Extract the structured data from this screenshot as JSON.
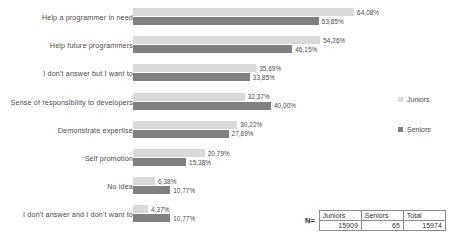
{
  "chart_data": {
    "type": "bar",
    "orientation": "horizontal",
    "title": "",
    "subtitle": "",
    "xlabel": "",
    "ylabel": "",
    "grid": false,
    "xlim": [
      0,
      70
    ],
    "legend_position": "right",
    "value_suffix": "%",
    "decimal_separator": ",",
    "categories": [
      "Help a programmer in need",
      "Help future programmers",
      "I don't answer but I want to",
      "Sense of responsibility to developers",
      "Demonstrate expertise",
      "Self promotion",
      "No idea",
      "I don't answer and I don't want to"
    ],
    "series": [
      {
        "name": "Juniors",
        "color": "#d9d9d9",
        "values": [
          64.08,
          54.26,
          35.69,
          32.37,
          30.22,
          20.79,
          6.38,
          4.37
        ],
        "labels": [
          "64,08%",
          "54,26%",
          "35,69%",
          "32,37%",
          "30,22%",
          "20,79%",
          "6,38%",
          "4,37%"
        ]
      },
      {
        "name": "Seniors",
        "color": "#808080",
        "values": [
          53.85,
          46.15,
          33.85,
          40.0,
          27.69,
          15.38,
          10.77,
          10.77
        ],
        "labels": [
          "53,85%",
          "46,15%",
          "33,85%",
          "40,00%",
          "27,69%",
          "15,38%",
          "10,77%",
          "10,77%"
        ]
      }
    ]
  },
  "legend": {
    "entries": [
      {
        "label": "Juniors"
      },
      {
        "label": "Seniors"
      }
    ]
  },
  "n_table": {
    "row_label": "N=",
    "headers": [
      "Juniors",
      "Seniors",
      "Total"
    ],
    "values": [
      "15909",
      "65",
      "15974"
    ]
  }
}
